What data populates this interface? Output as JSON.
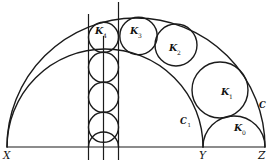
{
  "figure": {
    "colors": {
      "stroke": "#1b1b1b",
      "background": "#ffffff",
      "text": "#111111"
    },
    "points": {
      "X": {
        "text": "X"
      },
      "Y": {
        "text": "Y"
      },
      "Z": {
        "text": "Z"
      }
    },
    "outer_circle_label": {
      "main": "C",
      "sub": ""
    },
    "inner_circle_label": {
      "main": "C",
      "sub": "1"
    },
    "chain_labels": [
      {
        "main": "K",
        "sub": "0"
      },
      {
        "main": "K",
        "sub": "1"
      },
      {
        "main": "K",
        "sub": "2"
      },
      {
        "main": "K",
        "sub": "3"
      },
      {
        "main": "K",
        "sub": "4"
      }
    ]
  }
}
